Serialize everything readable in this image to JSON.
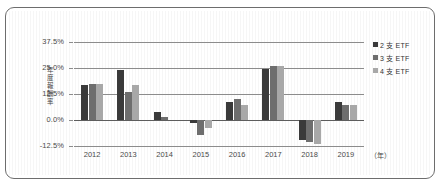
{
  "chart_data": {
    "type": "bar",
    "title": "",
    "subtitle": "",
    "xlabel": "（年）",
    "ylabel": "年度報酬率",
    "categories": [
      "2012",
      "2013",
      "2014",
      "2015",
      "2016",
      "2017",
      "2018",
      "2019"
    ],
    "series": [
      {
        "name": "2 支 ETF",
        "color": "#3a3a3a",
        "values": [
          17.0,
          24.0,
          4.0,
          -1.5,
          8.5,
          24.5,
          -9.5,
          8.5
        ]
      },
      {
        "name": "3 支 ETF",
        "color": "#6e6e6e",
        "values": [
          17.2,
          13.5,
          1.5,
          -7.0,
          10.0,
          26.0,
          -10.5,
          7.0
        ]
      },
      {
        "name": "4 支 ETF",
        "color": "#a8a8a8",
        "values": [
          17.5,
          17.0,
          0.0,
          -4.0,
          7.0,
          26.2,
          -11.5,
          7.0
        ]
      }
    ],
    "ylim": [
      -12.5,
      37.5
    ],
    "yticks": [
      37.5,
      25.0,
      12.5,
      0.0,
      -12.5
    ],
    "ytick_labels": [
      "37.5%",
      "25.0%",
      "12.5%",
      "0.0%",
      "-12.5%"
    ],
    "grid": true,
    "grid_axis": "y",
    "legend_position": "right-top"
  },
  "legend": {
    "items": [
      {
        "label": "2 支 ETF",
        "swatch": "#3a3a3a"
      },
      {
        "label": "3 支 ETF",
        "swatch": "#6e6e6e"
      },
      {
        "label": "4 支 ETF",
        "swatch": "#a8a8a8"
      }
    ]
  },
  "axes": {
    "y_title": "年度報酬率",
    "x_unit": "（年）"
  },
  "colors": {
    "frame_border": "#6d6d6d",
    "grid": "#8c8c8c",
    "axis": "#5d5d5d",
    "text": "#4a4a4a",
    "background": "#ffffff"
  }
}
